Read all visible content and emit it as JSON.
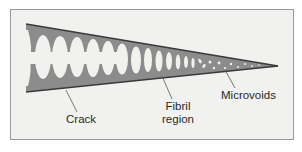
{
  "diagram": {
    "labels": {
      "crack": "Crack",
      "fibril_line1": "Fibril",
      "fibril_line2": "region",
      "microvoids": "Microvoids"
    },
    "colors": {
      "background": "#ffffff",
      "panel": "#f1f1ef",
      "frame_border": "#9a9a9a",
      "wedge_fill": "#8c8c8c",
      "wedge_edge": "#3a3a3a",
      "voids": "#f1f1ef",
      "leader_lines": "#555555",
      "text": "#2a2a2a"
    }
  }
}
